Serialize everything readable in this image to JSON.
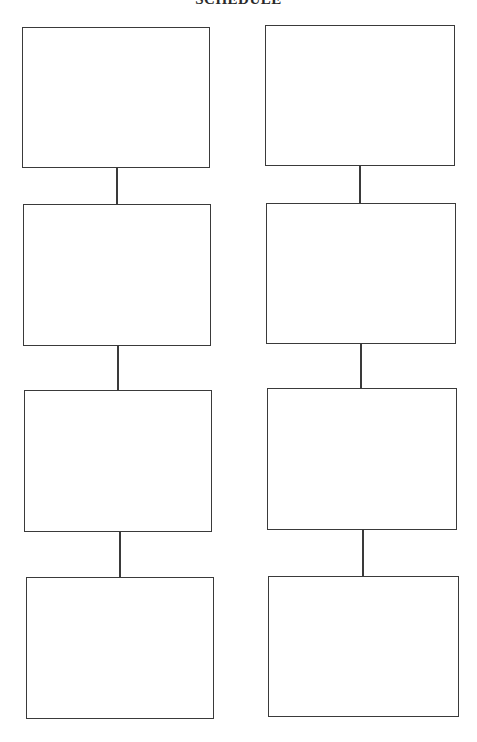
{
  "title": "SCHEDULE",
  "diagram": {
    "type": "two-column vertical flow of empty boxes",
    "columns": [
      {
        "name": "left",
        "boxes": [
          "",
          "",
          "",
          ""
        ]
      },
      {
        "name": "right",
        "boxes": [
          "",
          "",
          "",
          ""
        ]
      }
    ],
    "line_color": "#3a3a3a"
  }
}
